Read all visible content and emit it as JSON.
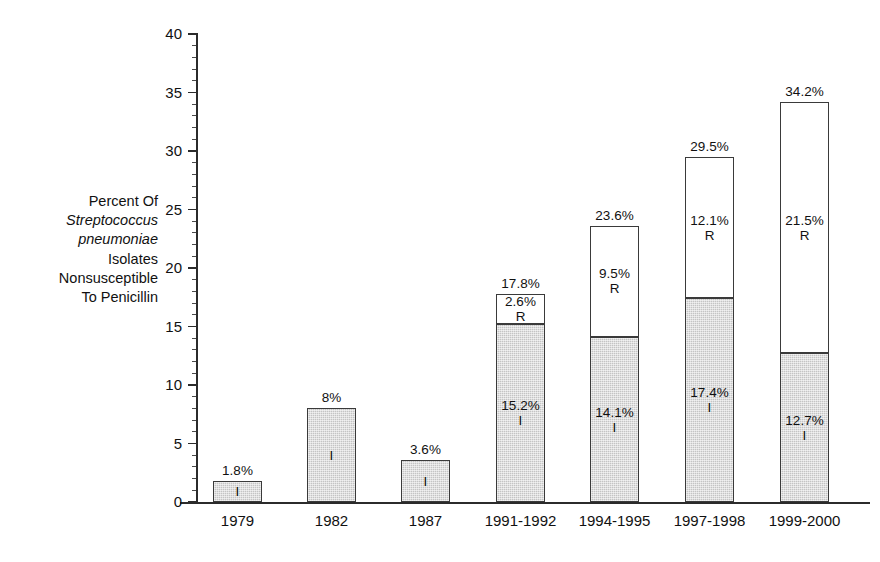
{
  "axis": {
    "y_label_lines": [
      {
        "text": "Percent Of",
        "italic": false
      },
      {
        "text": "Streptococcus",
        "italic": true
      },
      {
        "text": "pneumoniae",
        "italic": true
      },
      {
        "text": "Isolates",
        "italic": false
      },
      {
        "text": "Nonsusceptible",
        "italic": false
      },
      {
        "text": "To Penicillin",
        "italic": false
      }
    ],
    "y_ticks": [
      "0",
      "5",
      "10",
      "15",
      "20",
      "25",
      "30",
      "35",
      "40"
    ],
    "y_min": 0,
    "y_max": 40,
    "y_major_step": 5,
    "y_minor_step": 1,
    "x_label": ""
  },
  "legend_codes": {
    "intermediate": "I",
    "resistant": "R"
  },
  "colors": {
    "intermediate_fill": "#c4c4c4",
    "resistant_fill": "#ffffff",
    "bar_outline": "#3a3a3a",
    "axis": "#2b2b2b",
    "text": "#111111"
  },
  "caption": "",
  "chart_data": {
    "type": "bar",
    "title": "",
    "subtitle": "",
    "xlabel": "",
    "ylabel": "Percent Of Streptococcus pneumoniae Isolates Nonsusceptible To Penicillin",
    "ylim": [
      0,
      40
    ],
    "ytick_values": [
      0,
      5,
      10,
      15,
      20,
      25,
      30,
      35,
      40
    ],
    "grid": false,
    "legend_position": "in-bar",
    "stacked": true,
    "categories": [
      "1979",
      "1982",
      "1987",
      "1991-1992",
      "1994-1995",
      "1997-1998",
      "1999-2000"
    ],
    "series": [
      {
        "name": "I",
        "label": "Intermediate",
        "values": [
          1.8,
          8.0,
          3.6,
          15.2,
          14.1,
          17.4,
          12.7
        ],
        "value_labels": [
          "1.8%",
          "8%",
          "3.6%",
          "15.2%",
          "14.1%",
          "17.4%",
          "12.7%"
        ],
        "label_shown_inside": [
          false,
          false,
          false,
          true,
          true,
          true,
          true
        ]
      },
      {
        "name": "R",
        "label": "Resistant",
        "values": [
          0,
          0,
          0,
          2.6,
          9.5,
          12.1,
          21.5
        ],
        "value_labels": [
          "",
          "",
          "",
          "2.6%",
          "9.5%",
          "12.1%",
          "21.5%"
        ],
        "label_shown_inside": [
          false,
          false,
          false,
          true,
          true,
          true,
          true
        ]
      }
    ],
    "totals": [
      1.8,
      8.0,
      3.6,
      17.8,
      23.6,
      29.5,
      34.2
    ],
    "total_labels": [
      "1.8%",
      "8%",
      "3.6%",
      "17.8%",
      "23.6%",
      "29.5%",
      "34.2%"
    ]
  },
  "bars": [
    {
      "category": "1979",
      "total_label": "1.8%",
      "i_value": 1.8,
      "i_label": "",
      "i_code": "I",
      "r_value": 0,
      "r_label": "",
      "r_code": "R"
    },
    {
      "category": "1982",
      "total_label": "8%",
      "i_value": 8.0,
      "i_label": "",
      "i_code": "I",
      "r_value": 0,
      "r_label": "",
      "r_code": "R"
    },
    {
      "category": "1987",
      "total_label": "3.6%",
      "i_value": 3.6,
      "i_label": "",
      "i_code": "I",
      "r_value": 0,
      "r_label": "",
      "r_code": "R"
    },
    {
      "category": "1991-1992",
      "total_label": "17.8%",
      "i_value": 15.2,
      "i_label": "15.2%",
      "i_code": "I",
      "r_value": 2.6,
      "r_label": "2.6%",
      "r_code": "R"
    },
    {
      "category": "1994-1995",
      "total_label": "23.6%",
      "i_value": 14.1,
      "i_label": "14.1%",
      "i_code": "I",
      "r_value": 9.5,
      "r_label": "9.5%",
      "r_code": "R"
    },
    {
      "category": "1997-1998",
      "total_label": "29.5%",
      "i_value": 17.4,
      "i_label": "17.4%",
      "i_code": "I",
      "r_value": 12.1,
      "r_label": "12.1%",
      "r_code": "R"
    },
    {
      "category": "1999-2000",
      "total_label": "34.2%",
      "i_value": 12.7,
      "i_label": "12.7%",
      "i_code": "I",
      "r_value": 21.5,
      "r_label": "21.5%",
      "r_code": "R"
    }
  ]
}
